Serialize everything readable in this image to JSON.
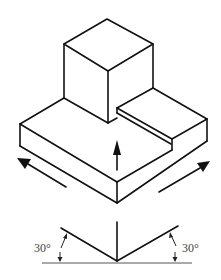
{
  "figure": {
    "colors": {
      "stroke": "#111111",
      "background": "#ffffff",
      "label": "#444444"
    }
  },
  "isometric_axes": {
    "left_angle_label": "30°",
    "right_angle_label": "30°"
  },
  "arrows": [
    {
      "name": "left-axis-arrow",
      "direction": "up-left"
    },
    {
      "name": "vertical-axis-arrow",
      "direction": "up"
    },
    {
      "name": "right-axis-arrow",
      "direction": "up-right"
    }
  ]
}
